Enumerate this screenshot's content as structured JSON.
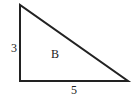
{
  "diagram": {
    "shape": "right-triangle",
    "stroke_color": "#222222",
    "vertices": [
      [
        20,
        5
      ],
      [
        20,
        81
      ],
      [
        128,
        81
      ]
    ],
    "labels": {
      "vertical_side": "3",
      "horizontal_side": "5",
      "interior": "B"
    }
  }
}
